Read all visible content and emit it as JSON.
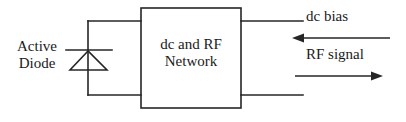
{
  "diagram": {
    "stroke_color": "#262626",
    "background_color": "#ffffff",
    "labels": {
      "active_diode_line1": "Active",
      "active_diode_line2": "Diode",
      "network_line1": "dc and RF",
      "network_line2": "Network",
      "dc_bias": "dc bias",
      "rf_signal": "RF signal"
    },
    "components": {
      "diode_symbol": "diode-triangle-up",
      "network_block": "rectangle",
      "dc_bias_arrow_direction": "left",
      "rf_signal_arrow_direction": "right"
    }
  }
}
